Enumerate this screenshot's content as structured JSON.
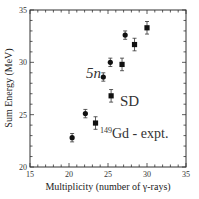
{
  "chart_data": {
    "type": "scatter",
    "title": "",
    "xlabel": "Multiplicity (number of γ-rays)",
    "ylabel": "Sum Energy (MeV)",
    "xlim": [
      15,
      35
    ],
    "ylim": [
      20,
      35
    ],
    "xticks": [
      15,
      20,
      25,
      30,
      35
    ],
    "yticks": [
      20,
      25,
      30,
      35
    ],
    "grid": false,
    "annotations": [
      {
        "text": "5n",
        "x": 23.2,
        "y": 28.8
      },
      {
        "text": "SD",
        "x": 28.0,
        "y": 26.3
      },
      {
        "text_sup": "149",
        "text": "Gd - expt.",
        "x": 27.5,
        "y": 23.1
      }
    ],
    "series": [
      {
        "name": "5n",
        "marker": "circle",
        "points": [
          {
            "x": 20.4,
            "y": 22.8,
            "err": 0.4
          },
          {
            "x": 22.1,
            "y": 25.1,
            "err": 0.4
          },
          {
            "x": 24.4,
            "y": 28.6,
            "err": 0.4
          },
          {
            "x": 25.3,
            "y": 30.0,
            "err": 0.4
          },
          {
            "x": 27.2,
            "y": 32.6,
            "err": 0.4
          }
        ]
      },
      {
        "name": "SD",
        "marker": "square",
        "points": [
          {
            "x": 23.4,
            "y": 24.2,
            "err": 0.6
          },
          {
            "x": 25.4,
            "y": 26.8,
            "err": 0.6
          },
          {
            "x": 26.8,
            "y": 29.8,
            "err": 0.6
          },
          {
            "x": 28.4,
            "y": 31.7,
            "err": 0.6
          },
          {
            "x": 30.0,
            "y": 33.3,
            "err": 0.6
          }
        ]
      }
    ]
  },
  "labels": {
    "xlabel": "Multiplicity (number of γ-rays)",
    "ylabel": "Sum Energy (MeV)",
    "ann_5n": "5n",
    "ann_sd": "SD",
    "ann_gd_sup": "149",
    "ann_gd": "Gd - expt."
  }
}
